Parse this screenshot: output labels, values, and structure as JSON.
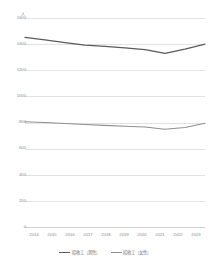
{
  "chart_data": {
    "type": "line",
    "title": "",
    "xlabel": "",
    "ylabel": "",
    "yunit": "人",
    "ylim": [
      0,
      1600
    ],
    "ytick_step": 200,
    "grid": true,
    "legend_position": "bottom",
    "x": [
      "2014",
      "2015",
      "2016",
      "2017",
      "2018",
      "2019",
      "2020",
      "2021",
      "2022",
      "2023"
    ],
    "yticks": [
      "0",
      "200",
      "400",
      "600",
      "800",
      "1000",
      "1200",
      "1400",
      "1600"
    ],
    "series": [
      {
        "name": "招收工（男性）",
        "color": "#5a5a5a",
        "values": [
          1452,
          1432,
          1412,
          1392,
          1383,
          1372,
          1358,
          1330,
          1362,
          1400
        ]
      },
      {
        "name": "招收工（女性）",
        "color": "#8f8f8f",
        "values": [
          806,
          800,
          792,
          784,
          778,
          772,
          766,
          748,
          762,
          795
        ]
      }
    ]
  },
  "legend": {
    "items": [
      {
        "label": "招收工（男性）"
      },
      {
        "label": "招收工（女性）"
      }
    ]
  }
}
